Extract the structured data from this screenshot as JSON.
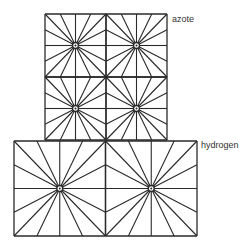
{
  "diagram": {
    "stroke_color": "#2a2a2a",
    "background": "#ffffff",
    "lattices": [
      {
        "name": "azote",
        "label": "azote",
        "label_pos": [
          172,
          15
        ],
        "frame": {
          "x": 45,
          "y": 14,
          "w": 122,
          "h": 126
        },
        "cols": 2,
        "rows": 2
      },
      {
        "name": "hydrogen",
        "label": "hydrogen",
        "label_pos": [
          201,
          141
        ],
        "frame": {
          "x": 14,
          "y": 141,
          "w": 183,
          "h": 95
        },
        "cols": 2,
        "rows": 1
      }
    ],
    "rays_per_edge_subdivisions": 4,
    "center_marker": "ring-with-dot"
  }
}
